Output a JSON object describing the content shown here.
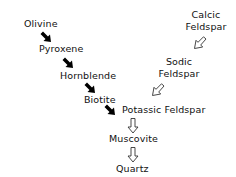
{
  "discontinuous_series": {
    "minerals": [
      "Olivine",
      "Pyroxene",
      "Hornblende",
      "Biotite"
    ],
    "arrow_style": "solid-black"
  },
  "continuous_series": {
    "minerals": [
      {
        "line1": "Calcic",
        "line2": "Feldspar"
      },
      {
        "line1": "Sodic",
        "line2": "Feldspar"
      }
    ],
    "arrow_style": "hollow-outline"
  },
  "merged_series": {
    "minerals": [
      "Potassic Feldspar",
      "Muscovite",
      "Quartz"
    ],
    "arrow_style": "hollow-outline"
  }
}
